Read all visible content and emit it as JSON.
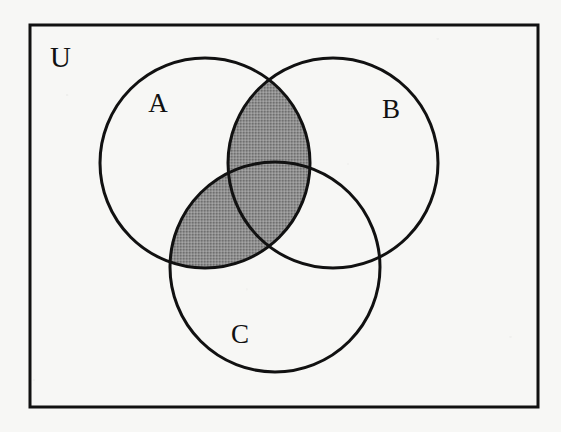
{
  "figure": {
    "kind": "venn-diagram",
    "set_count": 3,
    "universe_label": "U",
    "shaded_description": "A intersect (B union C)",
    "background_color": "#f7f7f5",
    "stroke_color": "#111111",
    "shade_color": "#8a8a8a",
    "frame": {
      "x": 30,
      "y": 25,
      "width": 508,
      "height": 382,
      "stroke_width": 3
    },
    "circles": [
      {
        "id": "A",
        "label": "A",
        "cx": 205,
        "cy": 163,
        "r": 105,
        "label_x": 158,
        "label_y": 112,
        "shaded": false
      },
      {
        "id": "B",
        "label": "B",
        "cx": 333,
        "cy": 163,
        "r": 105,
        "label_x": 383,
        "label_y": 118,
        "shaded": false
      },
      {
        "id": "C",
        "label": "C",
        "cx": 275,
        "cy": 267,
        "r": 105,
        "label_x": 231,
        "label_y": 343,
        "shaded": false
      }
    ],
    "universe": {
      "label": "U",
      "label_x": 50,
      "label_y": 67
    },
    "regions": [
      {
        "id": "A-only",
        "name": "A only",
        "shaded": false
      },
      {
        "id": "B-only",
        "name": "B only",
        "shaded": false
      },
      {
        "id": "C-only",
        "name": "C only",
        "shaded": false
      },
      {
        "id": "A-and-B",
        "name": "A and B not C",
        "shaded": true
      },
      {
        "id": "A-and-C",
        "name": "A and C not B",
        "shaded": true
      },
      {
        "id": "B-and-C",
        "name": "B and C not A",
        "shaded": false
      },
      {
        "id": "A-B-C",
        "name": "A and B and C",
        "shaded": true
      },
      {
        "id": "outside",
        "name": "outside all sets",
        "shaded": false
      }
    ]
  }
}
